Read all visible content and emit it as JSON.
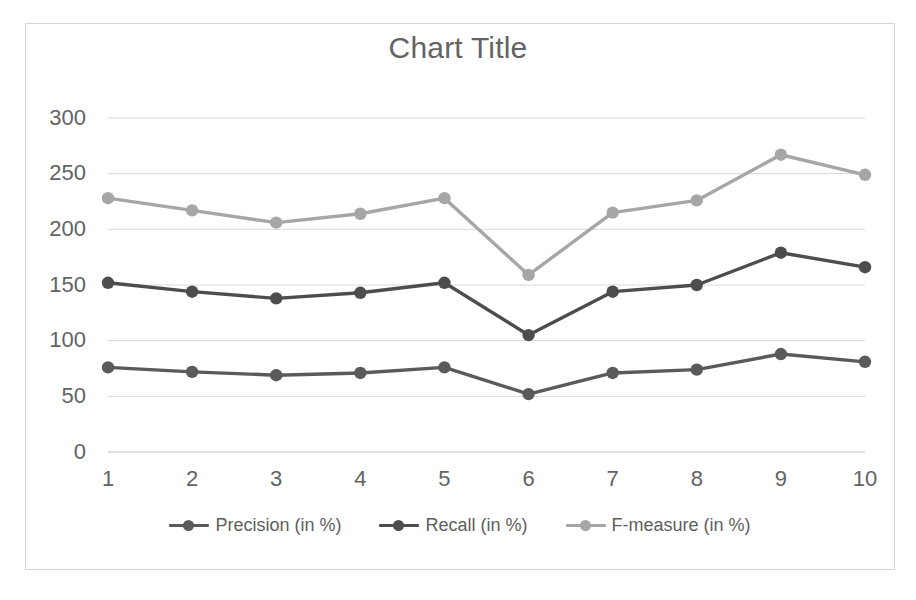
{
  "chart_data": {
    "type": "line",
    "title": "Chart Title",
    "xlabel": "",
    "ylabel": "",
    "categories": [
      "1",
      "2",
      "3",
      "4",
      "5",
      "6",
      "7",
      "8",
      "9",
      "10"
    ],
    "x": [
      1,
      2,
      3,
      4,
      5,
      6,
      7,
      8,
      9,
      10
    ],
    "ylim": [
      0,
      300
    ],
    "yticks": [
      0,
      50,
      100,
      150,
      200,
      250,
      300
    ],
    "ytick_labels": [
      "0",
      "50",
      "100",
      "150",
      "200",
      "250",
      "300"
    ],
    "grid": true,
    "grid_axis": "y",
    "legend_position": "bottom",
    "series": [
      {
        "name": "Precision (in %)",
        "color": "#5a5a5a",
        "values": [
          76,
          72,
          69,
          71,
          76,
          52,
          71,
          74,
          88,
          81
        ]
      },
      {
        "name": "Recall (in %)",
        "color": "#4d4d4d",
        "values": [
          152,
          144,
          138,
          143,
          152,
          105,
          144,
          150,
          179,
          166
        ]
      },
      {
        "name": "F-measure (in %)",
        "color": "#a6a6a6",
        "values": [
          228,
          217,
          206,
          214,
          228,
          159,
          215,
          226,
          267,
          249
        ]
      }
    ]
  },
  "colors": {
    "frame_border": "#d4d4d4",
    "gridline": "#d9d9d9",
    "axis": "#bfbfbf",
    "text": "#636363",
    "background": "#ffffff"
  }
}
